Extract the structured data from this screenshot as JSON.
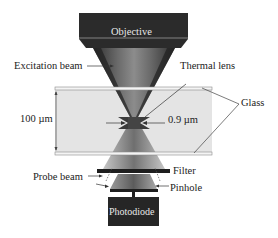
{
  "diagram": {
    "type": "thermal-lens-microscope-schematic",
    "components": {
      "objective": {
        "label": "Objective"
      },
      "photodiode": {
        "label": "Photodiode"
      }
    },
    "labels": {
      "excitation_beam": "Excitation beam",
      "thermal_lens": "Thermal lens",
      "glass": "Glass",
      "thickness": "100 µm",
      "spot_size": "0.9 µm",
      "filter": "Filter",
      "probe_beam": "Probe beam",
      "pinhole": "Pinhole"
    },
    "colors": {
      "objective_body": "#2b2b2b",
      "beam_dark": "#3a3a3a",
      "beam_light": "#9a9a9a",
      "glass_fill": "#e6e6e6",
      "glass_plate": "#f2f2f2",
      "filter": "#1e1e1e",
      "photodiode_body": "#262626"
    }
  }
}
